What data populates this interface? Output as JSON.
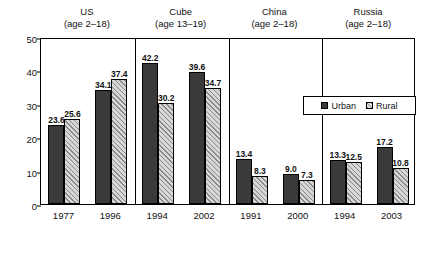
{
  "chart_data": {
    "type": "bar",
    "title": "",
    "xlabel": "",
    "ylabel": "Percent",
    "ylim": [
      0,
      50
    ],
    "yticks": [
      0,
      10,
      20,
      30,
      40,
      50
    ],
    "grid": false,
    "legend_position": "inside-top-right",
    "categories": [
      "1977",
      "1996",
      "1994",
      "2002",
      "1991",
      "2000",
      "1994",
      "2003"
    ],
    "series": [
      {
        "name": "Urban",
        "values": [
          23.6,
          34.1,
          42.2,
          39.6,
          13.4,
          9.0,
          13.3,
          17.2
        ]
      },
      {
        "name": "Rural",
        "values": [
          25.6,
          37.4,
          30.2,
          34.7,
          8.3,
          7.3,
          12.5,
          10.8
        ]
      }
    ],
    "groups": [
      {
        "name": "US",
        "age": "(age 2–18)",
        "categories": [
          "1977",
          "1996"
        ]
      },
      {
        "name": "Cube",
        "age": "(age 13–19)",
        "categories": [
          "1994",
          "2002"
        ]
      },
      {
        "name": "China",
        "age": "(age 2–18)",
        "categories": [
          "1991",
          "2000"
        ]
      },
      {
        "name": "Russia",
        "age": "(age 2–18)",
        "categories": [
          "1994",
          "2003"
        ]
      }
    ],
    "bar_labels": [
      "23.6",
      "25.6",
      "34.1",
      "37.4",
      "42.2",
      "30.2",
      "39.6",
      "34.7",
      "13.4",
      "8.3",
      "9.0",
      "7.3",
      "13.3",
      "12.5",
      "17.2",
      "10.8"
    ],
    "colors": {
      "urban": "#3a3a3a",
      "rural": "#d6d6d6",
      "axis": "#000000"
    }
  },
  "groups": [
    {
      "name": "US",
      "age": "(age 2–18)"
    },
    {
      "name": "Cube",
      "age": "(age 13–19)"
    },
    {
      "name": "China",
      "age": "(age 2–18)"
    },
    {
      "name": "Russia",
      "age": "(age 2–18)"
    }
  ],
  "axis": {
    "y_title": "Percent",
    "y_ticks": [
      "50",
      "40",
      "30",
      "20",
      "10",
      "0"
    ],
    "x_ticks": [
      "1977",
      "1996",
      "1994",
      "2002",
      "1991",
      "2000",
      "1994",
      "2003"
    ]
  },
  "legend": {
    "urban_label": "Urban",
    "rural_label": "Rural"
  }
}
